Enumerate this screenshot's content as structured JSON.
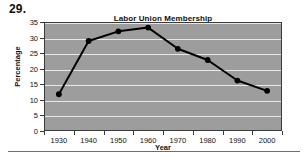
{
  "question_number": "29.",
  "chart_data": {
    "type": "line",
    "title": "Labor Union Membership",
    "xlabel": "Year",
    "ylabel": "Percentage",
    "categories": [
      "1930",
      "1940",
      "1950",
      "1960",
      "1970",
      "1980",
      "1990",
      "2000"
    ],
    "values": [
      11.8,
      28.9,
      32.0,
      33.2,
      26.4,
      22.8,
      16.2,
      12.9
    ],
    "ylim": [
      0,
      35
    ],
    "ytick_labels": [
      "0",
      "5",
      "10",
      "15",
      "20",
      "25",
      "30",
      "35"
    ],
    "ytick_values": [
      0,
      5,
      10,
      15,
      20,
      25,
      30,
      35
    ],
    "grid": true,
    "legend": "none",
    "plot_background": "#9d9d9d",
    "gridline_color": "#e8e8e8",
    "series_color": "#000000",
    "marker": "circle"
  }
}
